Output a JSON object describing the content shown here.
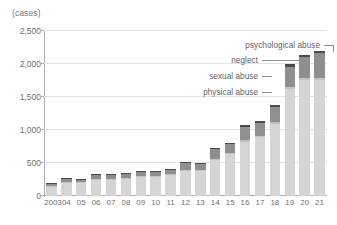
{
  "chart_data": {
    "type": "bar",
    "subtype": "stacked-bar",
    "title": "",
    "unit_label": "(cases)",
    "xlabel": "",
    "ylabel": "",
    "ylim": [
      0,
      2500
    ],
    "ytick_values": [
      0,
      500,
      1000,
      1500,
      2000,
      2500
    ],
    "ytick_labels": [
      "0",
      "500",
      "1,000",
      "1,500",
      "2,000",
      "2,500"
    ],
    "grid": true,
    "legend_position": "callout-annotations",
    "categories": [
      "2003",
      "04",
      "05",
      "06",
      "07",
      "08",
      "09",
      "10",
      "11",
      "12",
      "13",
      "14",
      "15",
      "16",
      "17",
      "18",
      "19",
      "20",
      "21"
    ],
    "series": [
      {
        "name": "physical abuse",
        "color": "#d5d5d5",
        "values": [
          150,
          205,
          205,
          250,
          255,
          265,
          290,
          295,
          320,
          390,
          380,
          545,
          645,
          825,
          890,
          1090,
          1620,
          1755,
          1760
        ]
      },
      {
        "name": "sexual abuse",
        "color": "#c2c2c2",
        "values": [
          5,
          8,
          8,
          8,
          8,
          8,
          8,
          8,
          8,
          10,
          10,
          12,
          14,
          18,
          20,
          24,
          32,
          34,
          34
        ]
      },
      {
        "name": "neglect",
        "color": "#8f8f8f",
        "values": [
          30,
          45,
          40,
          60,
          60,
          62,
          65,
          62,
          70,
          95,
          95,
          150,
          130,
          205,
          195,
          230,
          305,
          315,
          370
        ]
      },
      {
        "name": "psychological abuse",
        "color": "#4a4a4a",
        "values": [
          8,
          12,
          12,
          14,
          14,
          15,
          15,
          15,
          18,
          18,
          18,
          22,
          22,
          30,
          30,
          34,
          38,
          38,
          40
        ]
      }
    ],
    "totals": [
      193,
      270,
      265,
      332,
      337,
      350,
      378,
      380,
      416,
      513,
      503,
      729,
      811,
      1078,
      1135,
      1378,
      1995,
      2142,
      2204
    ],
    "annotations": [
      {
        "label": "psychological abuse",
        "target_series": "psychological abuse"
      },
      {
        "label": "neglect",
        "target_series": "neglect"
      },
      {
        "label": "sexual abuse",
        "target_series": "sexual abuse"
      },
      {
        "label": "physical abuse",
        "target_series": "physical abuse"
      }
    ]
  }
}
